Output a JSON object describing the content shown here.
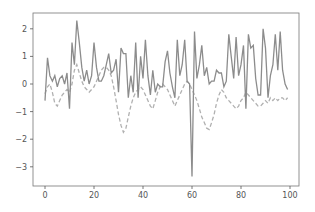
{
  "chart_data": {
    "type": "line",
    "title": "",
    "xlabel": "",
    "ylabel": "",
    "xlim": [
      -5,
      105
    ],
    "ylim": [
      -3.6,
      2.6
    ],
    "grid": false,
    "legend": null,
    "x_ticks": [
      0,
      20,
      40,
      60,
      80,
      100
    ],
    "y_ticks": [
      2,
      1,
      0,
      -1,
      -2,
      -3
    ],
    "x_tick_labels": [
      "0",
      "20",
      "40",
      "60",
      "80",
      "100"
    ],
    "y_tick_labels": [
      "2",
      "1",
      "0",
      "−1",
      "−2",
      "−3"
    ],
    "series": [
      {
        "name": "data",
        "style": "solid",
        "color": "#8c8c8c",
        "values": [
          -0.6,
          0.95,
          0.3,
          0.1,
          0.3,
          -0.1,
          0.2,
          0.3,
          0.0,
          0.4,
          -0.9,
          1.5,
          0.7,
          2.3,
          1.5,
          0.6,
          0.1,
          0.5,
          0.0,
          0.3,
          1.5,
          0.6,
          0.1,
          0.1,
          0.3,
          0.7,
          1.1,
          0.4,
          0.5,
          0.9,
          -0.3,
          1.3,
          1.1,
          1.1,
          -0.5,
          0.3,
          -0.3,
          1.5,
          -0.5,
          1.0,
          0.2,
          1.6,
          0.3,
          -0.4,
          0.5,
          -0.3,
          0.0,
          -0.1,
          -0.1,
          0.8,
          1.2,
          0.4,
          -0.1,
          -0.5,
          1.6,
          0.3,
          0.7,
          1.6,
          0.1,
          0.0,
          -3.35,
          1.9,
          0.2,
          0.7,
          1.4,
          0.3,
          0.6,
          0.0,
          0.1,
          0.1,
          0.5,
          0.4,
          0.4,
          -0.1,
          0.1,
          1.8,
          1.0,
          0.2,
          1.7,
          0.3,
          0.7,
          1.4,
          -0.9,
          1.8,
          1.3,
          1.4,
          0.2,
          -0.4,
          -0.4,
          2.0,
          1.3,
          -0.5,
          0.3,
          0.7,
          1.8,
          0.5,
          1.9,
          0.5,
          0.0,
          -0.2
        ]
      },
      {
        "name": "smoothed",
        "style": "dashed",
        "color": "#b0b0b0",
        "values": [
          -0.35,
          -0.1,
          0.0,
          -0.3,
          -0.7,
          -0.8,
          -0.6,
          -0.4,
          -0.3,
          -0.2,
          -0.3,
          0.0,
          0.5,
          0.7,
          0.4,
          0.1,
          -0.1,
          -0.2,
          -0.3,
          -0.2,
          -0.1,
          0.1,
          0.3,
          0.5,
          0.6,
          0.6,
          0.5,
          0.3,
          -0.1,
          -0.6,
          -1.1,
          -1.5,
          -1.75,
          -1.6,
          -1.2,
          -0.8,
          -0.5,
          -0.3,
          -0.2,
          -0.1,
          -0.2,
          -0.4,
          -0.6,
          -0.8,
          -0.9,
          -0.6,
          -0.3,
          -0.1,
          0.0,
          -0.1,
          -0.2,
          -0.4,
          -0.6,
          -0.8,
          -0.6,
          -0.4,
          -0.2,
          0.0,
          0.1,
          0.0,
          -0.2,
          -0.4,
          -0.6,
          -0.9,
          -1.2,
          -1.4,
          -1.6,
          -1.65,
          -1.4,
          -1.1,
          -0.7,
          -0.4,
          -0.2,
          -0.3,
          -0.5,
          -0.6,
          -0.7,
          -0.8,
          -0.9,
          -0.8,
          -0.6,
          -0.5,
          -0.3,
          -0.4,
          -0.5,
          -0.6,
          -0.7,
          -0.8,
          -0.8,
          -0.7,
          -0.6,
          -0.7,
          -0.5,
          -0.6,
          -0.5,
          -0.6,
          -0.5,
          -0.5,
          -0.6,
          -0.5
        ]
      }
    ]
  },
  "colors": {
    "axis": "#555555",
    "solid_line": "#8c8c8c",
    "dashed_line": "#b0b0b0",
    "background": "#ffffff"
  }
}
